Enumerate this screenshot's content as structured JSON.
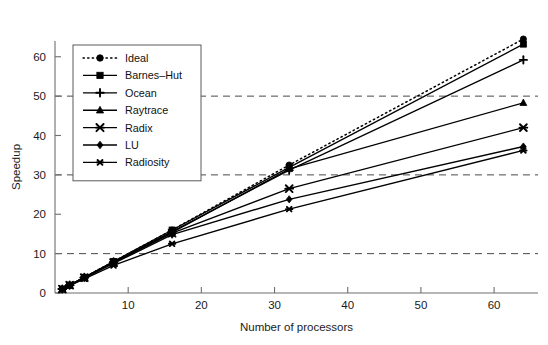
{
  "chart_data": {
    "type": "line",
    "title": "",
    "xlabel": "Number of processors",
    "ylabel": "Speedup",
    "x": [
      1,
      2,
      4,
      8,
      16,
      32,
      64
    ],
    "xlim": [
      0,
      66
    ],
    "ylim": [
      0,
      64
    ],
    "xticks": [
      10,
      20,
      30,
      40,
      50,
      60
    ],
    "yticks": [
      0,
      10,
      20,
      30,
      40,
      50,
      60
    ],
    "xtick_labels": [
      "10",
      "20",
      "30",
      "40",
      "50",
      "60"
    ],
    "ytick_labels": [
      "0",
      "10",
      "20",
      "30",
      "40",
      "50",
      "60"
    ],
    "grid": "horizontal-dashed",
    "gridlines_y": [
      10,
      30,
      50
    ],
    "legend_position": "upper-left",
    "series": [
      {
        "name": "Ideal",
        "marker": "circle",
        "style": "dotted",
        "values": [
          1,
          2,
          4,
          8,
          16,
          32.5,
          64.5
        ]
      },
      {
        "name": "Barnes–Hut",
        "marker": "square",
        "style": "solid",
        "values": [
          1,
          2,
          4,
          8,
          16,
          31.9,
          63.2
        ]
      },
      {
        "name": "Ocean",
        "marker": "plus",
        "style": "solid",
        "values": [
          1,
          2,
          4,
          7.9,
          15.6,
          31.2,
          59.2
        ]
      },
      {
        "name": "Raytrace",
        "marker": "triangle",
        "style": "solid",
        "values": [
          1,
          2,
          3.9,
          7.8,
          15.4,
          31.5,
          48.3
        ]
      },
      {
        "name": "Radix",
        "marker": "x",
        "style": "solid",
        "values": [
          1,
          2,
          3.9,
          7.7,
          15.2,
          26.5,
          42.0
        ]
      },
      {
        "name": "LU",
        "marker": "diamond",
        "style": "solid",
        "values": [
          1,
          1.9,
          3.8,
          7.5,
          14.8,
          23.8,
          37.2
        ]
      },
      {
        "name": "Radiosity",
        "marker": "star",
        "style": "solid",
        "values": [
          1,
          1.9,
          3.6,
          7.0,
          12.5,
          21.3,
          36.2
        ]
      }
    ]
  }
}
